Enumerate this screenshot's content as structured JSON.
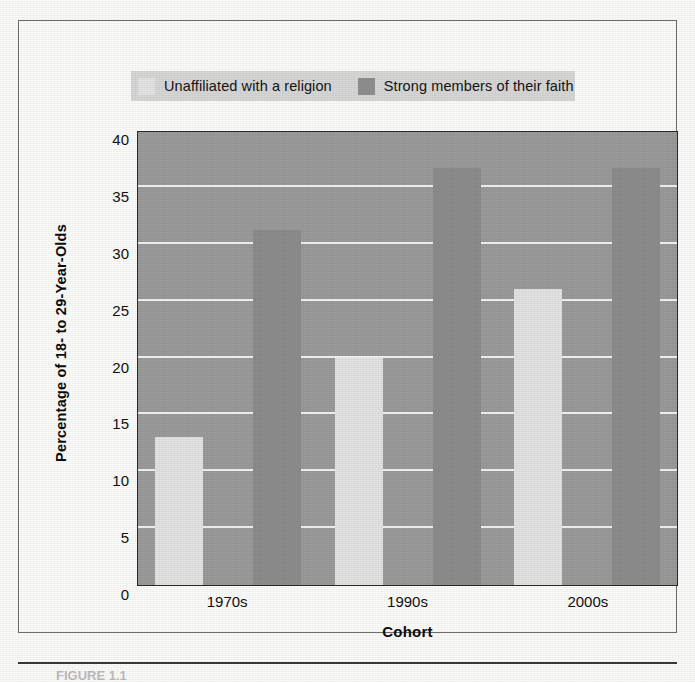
{
  "figure": {
    "caption": "FIGURE 1.1"
  },
  "legend": {
    "position": "top",
    "entries": [
      {
        "label": "Unaffiliated with a religion",
        "swatch_icon": "legend-swatch-light",
        "color": "#e4e4e4"
      },
      {
        "label": "Strong members of their faith",
        "swatch_icon": "legend-swatch-dark",
        "color": "#8f8f8f"
      }
    ]
  },
  "chart_data": {
    "type": "bar",
    "title": "",
    "xlabel": "Cohort",
    "ylabel": "Percentage of 18- to 29-Year-Olds",
    "categories": [
      "1970s",
      "1990s",
      "2000s"
    ],
    "series": [
      {
        "name": "Unaffiliated with a religion",
        "color": "#e3e3e3",
        "values": [
          13.0,
          20.0,
          26.0
        ]
      },
      {
        "name": "Strong members of their faith",
        "color": "#8d8d8d",
        "values": [
          31.2,
          36.7,
          36.7
        ]
      }
    ],
    "ylim": [
      0,
      40
    ],
    "ytick_values": [
      0,
      5,
      10,
      15,
      20,
      25,
      30,
      35,
      40
    ],
    "ytick_labels": [
      "0",
      "5",
      "10",
      "15",
      "20",
      "25",
      "30",
      "35",
      "40"
    ],
    "grid": true,
    "grid_color": "#f2f2f2",
    "plot_background": "#9b9b9b",
    "legend_position": "above-plot"
  }
}
